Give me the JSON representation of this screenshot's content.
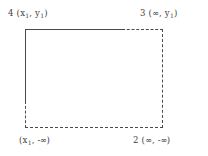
{
  "figure": {
    "title": "",
    "type": "rectangle-region-diagram",
    "corner_labels": [
      {
        "id": "corner-4",
        "index": "4",
        "open_paren": "(",
        "x_symbol": "x",
        "x_sub": "1",
        "separator": ", ",
        "y_symbol": "y",
        "y_sub": "1",
        "close_paren": ")",
        "text": "4  (x1, y1)",
        "position": "top-left"
      },
      {
        "id": "corner-3",
        "index": "3",
        "open_paren": "(",
        "x_symbol": "∞",
        "x_sub": "",
        "separator": ", ",
        "y_symbol": "y",
        "y_sub": "1",
        "close_paren": ")",
        "text": "3  (∞, y1)",
        "position": "top-right"
      },
      {
        "id": "corner-1",
        "index": "",
        "open_paren": "(",
        "x_symbol": "x",
        "x_sub": "1",
        "separator": ", ",
        "y_symbol": "-∞",
        "y_sub": "",
        "close_paren": ")",
        "text": "(x1, -∞)",
        "position": "bottom-left"
      },
      {
        "id": "corner-2",
        "index": "2",
        "open_paren": "(",
        "x_symbol": "∞",
        "x_sub": "",
        "separator": ", ",
        "y_symbol": "-∞",
        "y_sub": "",
        "close_paren": ")",
        "text": "2  (∞, -∞)",
        "position": "bottom-right"
      }
    ],
    "edges": [
      {
        "id": "top-solid",
        "style": "solid",
        "orientation": "horizontal"
      },
      {
        "id": "top-dashed",
        "style": "dashed",
        "orientation": "horizontal"
      },
      {
        "id": "left-solid",
        "style": "solid",
        "orientation": "vertical"
      },
      {
        "id": "left-dashed",
        "style": "dashed",
        "orientation": "vertical"
      },
      {
        "id": "right-dashed",
        "style": "dashed",
        "orientation": "vertical"
      },
      {
        "id": "bottom-dashed",
        "style": "dashed",
        "orientation": "horizontal"
      }
    ],
    "colors": {
      "line": "#4a4a4a",
      "text": "#3d3d3d",
      "background": "#ffffff"
    }
  }
}
